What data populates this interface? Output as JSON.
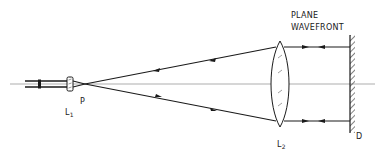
{
  "diagram": {
    "type": "optical-setup",
    "title_label": [
      "PLANE",
      "WAVEFRONT"
    ],
    "labels": {
      "lens1": {
        "main": "L",
        "sub": "1"
      },
      "focus_point": "P",
      "lens2": {
        "main": "L",
        "sub": "2"
      },
      "mirror": "D"
    },
    "colors": {
      "ink": "#1a1a1a",
      "axis": "#8a8a8a",
      "background": "#ffffff"
    },
    "components": [
      {
        "id": "L1",
        "kind": "small-lens",
        "role": "focusing lens"
      },
      {
        "id": "P",
        "kind": "focal-point"
      },
      {
        "id": "L2",
        "kind": "biconvex-lens",
        "role": "collimating lens"
      },
      {
        "id": "D",
        "kind": "plane-mirror"
      }
    ],
    "rays": [
      {
        "from": "input",
        "to": "L1",
        "direction": "right"
      },
      {
        "from": "P",
        "to": "L2",
        "path": "upper",
        "arrows": [
          "left",
          "left"
        ]
      },
      {
        "from": "P",
        "to": "L2",
        "path": "lower",
        "arrows": [
          "right",
          "left"
        ]
      },
      {
        "from": "L2",
        "to": "D",
        "path": "upper",
        "arrows": [
          "right",
          "left"
        ]
      },
      {
        "from": "L2",
        "to": "D",
        "path": "lower",
        "arrows": [
          "right",
          "left"
        ]
      }
    ]
  }
}
